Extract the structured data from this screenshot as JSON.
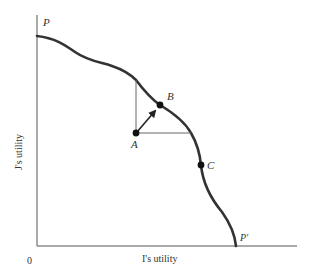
{
  "diagram": {
    "type": "utility-possibility-frontier",
    "axes": {
      "x_label": "I's utility",
      "y_label": "J's utility",
      "origin_label": "0"
    },
    "curve": {
      "start_label": "P",
      "end_label": "P′"
    },
    "points": {
      "A": "A",
      "B": "B",
      "C": "C"
    },
    "colors": {
      "curve": "#333333",
      "axis": "#555555",
      "guide": "#666666",
      "text": "#333333"
    }
  }
}
